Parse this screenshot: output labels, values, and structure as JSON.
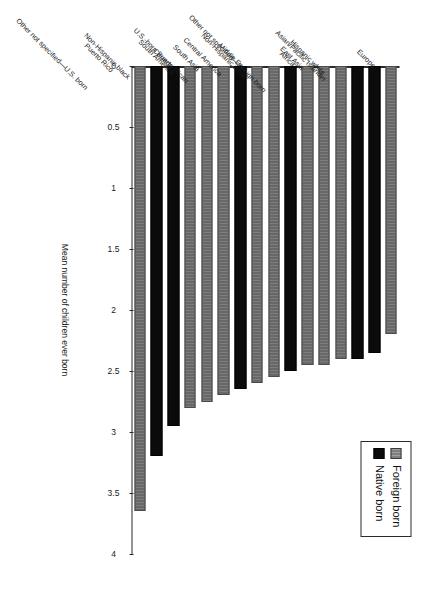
{
  "figure": {
    "orientation_note": "rotated-90",
    "background": "#ffffff"
  },
  "legend": {
    "items": [
      {
        "label": "Foreign born",
        "color": "#8a8a8a",
        "series": "foreign"
      },
      {
        "label": "Native born",
        "color": "#0b0b0b",
        "series": "native"
      }
    ]
  },
  "axis": {
    "value_title": "Mean number of children ever born",
    "ticks": [
      "0",
      "0.5",
      "1",
      "1.5",
      "2",
      "2.5",
      "3",
      "3.5",
      "4"
    ]
  },
  "chart_data": {
    "type": "bar",
    "orientation": "horizontal",
    "title": "",
    "xlabel": "Mean number of children ever born",
    "ylabel": "",
    "xlim": [
      0,
      4
    ],
    "grid": false,
    "legend_position": "top-left",
    "legend_entries": [
      "Foreign born",
      "Native born"
    ],
    "categories": [
      "Puerto Rico",
      "Other not specified—U.S. born",
      "Non-Hispanic black",
      "Canada",
      "South America",
      "South Asia",
      "U.S.-born Puerto Rican",
      "Central America",
      "Middle East",
      "Non-Hispanic white",
      "Africa",
      "East Asia",
      "Other not specified—foreign born",
      "Hispanic white",
      "Asian/Pacific Islander",
      "Europe"
    ],
    "groups": [
      "foreign",
      "native",
      "native",
      "foreign",
      "foreign",
      "foreign",
      "native",
      "foreign",
      "foreign",
      "native",
      "foreign",
      "foreign",
      "foreign",
      "native",
      "native",
      "foreign"
    ],
    "values": [
      3.65,
      3.2,
      2.95,
      2.8,
      2.75,
      2.7,
      2.65,
      2.6,
      2.55,
      2.5,
      2.45,
      2.45,
      2.4,
      2.4,
      2.35,
      2.2
    ]
  }
}
